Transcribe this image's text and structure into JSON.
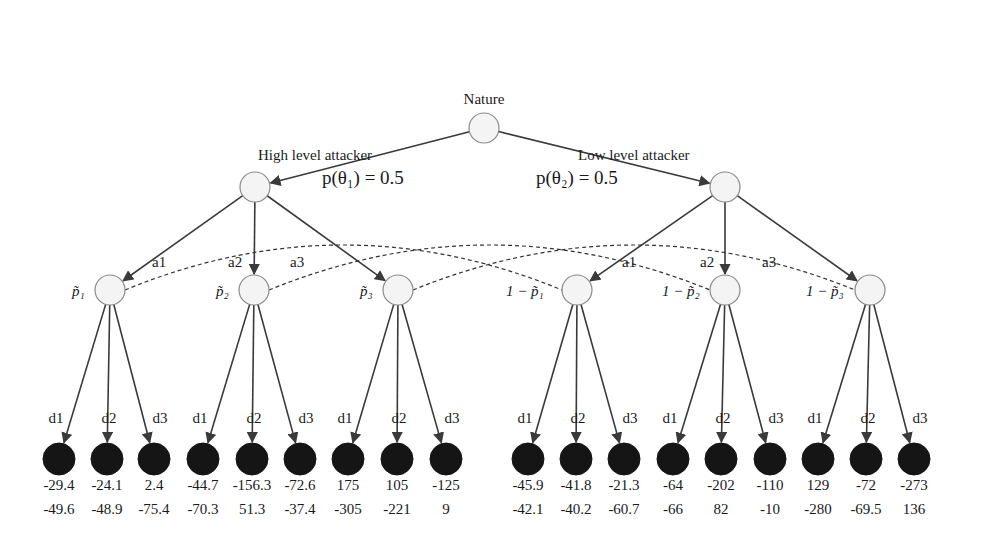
{
  "diagram": {
    "type": "signaling-game-tree",
    "root": {
      "label": "Nature"
    },
    "types": [
      {
        "id": "theta1",
        "branch_label": "High level attacker",
        "prob_label": "p(θ₁) = 0.5",
        "probability": 0.5
      },
      {
        "id": "theta2",
        "branch_label": "Low level attacker",
        "prob_label": "p(θ₂) = 0.5",
        "probability": 0.5
      }
    ],
    "attacker_actions": [
      "a1",
      "a2",
      "a3"
    ],
    "defender_actions": [
      "d1",
      "d2",
      "d3"
    ],
    "beliefs": [
      {
        "label": "p̃₁",
        "type": "theta1"
      },
      {
        "label": "p̃₂",
        "type": "theta1"
      },
      {
        "label": "p̃₃",
        "type": "theta1"
      },
      {
        "label": "1 − p̃₁",
        "type": "theta2"
      },
      {
        "label": "1 − p̃₂",
        "type": "theta2"
      },
      {
        "label": "1 − p̃₃",
        "type": "theta2"
      }
    ],
    "information_sets": [
      [
        0,
        3
      ],
      [
        1,
        4
      ],
      [
        2,
        5
      ]
    ],
    "leaves": [
      {
        "top": "-29.4",
        "bottom": "-49.6"
      },
      {
        "top": "-24.1",
        "bottom": "-48.9"
      },
      {
        "top": "2.4",
        "bottom": "-75.4"
      },
      {
        "top": "-44.7",
        "bottom": "-70.3"
      },
      {
        "top": "-156.3",
        "bottom": "51.3"
      },
      {
        "top": "-72.6",
        "bottom": "-37.4"
      },
      {
        "top": "175",
        "bottom": "-305"
      },
      {
        "top": "105",
        "bottom": "-221"
      },
      {
        "top": "-125",
        "bottom": "9"
      },
      {
        "top": "-45.9",
        "bottom": "-42.1"
      },
      {
        "top": "-41.8",
        "bottom": "-40.2"
      },
      {
        "top": "-21.3",
        "bottom": "-60.7"
      },
      {
        "top": "-64",
        "bottom": "-66"
      },
      {
        "top": "-202",
        "bottom": "82"
      },
      {
        "top": "-110",
        "bottom": "-10"
      },
      {
        "top": "129",
        "bottom": "-280"
      },
      {
        "top": "-72",
        "bottom": "-69.5"
      },
      {
        "top": "-273",
        "bottom": "136"
      }
    ]
  }
}
